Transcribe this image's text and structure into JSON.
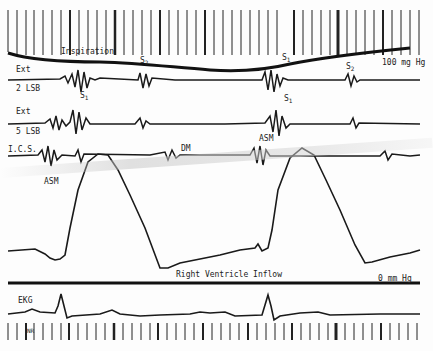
{
  "figure": {
    "type": "phonocardiogram tracing",
    "labels": {
      "inspiration": "Inspiration",
      "pressure_high": "100 mg Hg",
      "pressure_low": "0 mm Hg",
      "rv_inflow": "Right Ventricle Inflow",
      "ekg": "EKG",
      "nr": "NR",
      "ch1_top": "Ext",
      "ch1_bottom": "2 LSB",
      "ch2_top": "Ext",
      "ch2_bottom": "5 LSB",
      "ch3": "I.C.S.",
      "dm": "DM",
      "asm_1": "ASM",
      "asm_2": "ASM",
      "s1": "S",
      "s2": "S",
      "sub1": "1",
      "sub2": "2"
    },
    "colors": {
      "trace": "#1a1a1a",
      "paper": "#fdfdfd"
    }
  }
}
